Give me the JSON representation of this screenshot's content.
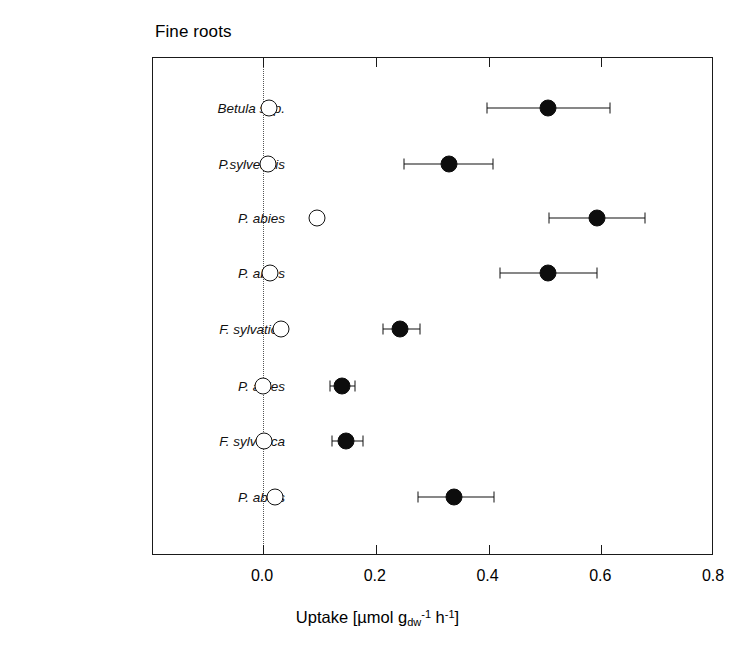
{
  "chart_data": {
    "type": "scatter",
    "title": "Fine roots",
    "xlabel": "Uptake [µmol g",
    "xlabel_sub": "dw",
    "xlabel_sup1": "-1",
    "xlabel_mid": " h",
    "xlabel_sup2": "-1",
    "xlabel_end": "]",
    "xlim": [
      0.0,
      0.8
    ],
    "xticks": [
      0.0,
      0.2,
      0.4,
      0.6,
      0.8
    ],
    "xtick_labels": [
      "0.0",
      "0.2",
      "0.4",
      "0.6",
      "0.8"
    ],
    "grid": false,
    "zero_reference_line": 0.0,
    "legend_position": "bottom-right",
    "legend": [
      {
        "key": "NO3",
        "label_main": "NO",
        "label_sub": "3",
        "label_sup": "-",
        "marker": "open-circle"
      },
      {
        "key": "NH4",
        "label_main": "NH",
        "label_sub": "4",
        "label_sup": "+",
        "marker": "filled-circle"
      }
    ],
    "site_labels": [
      {
        "name": "Åheden",
        "row": 0
      },
      {
        "name": "Klosterhede",
        "row": 3
      },
      {
        "name": "Schacht",
        "row": 4
      },
      {
        "name": "Waldstein",
        "row": 5
      },
      {
        "name": "Aubure",
        "row": 6
      }
    ],
    "categories": [
      "Betula spp.",
      "P.sylvestris",
      "P. abies",
      "P. abies",
      "F. sylvatica",
      "P. abies",
      "F. sylvatica",
      "P. abies"
    ],
    "series": [
      {
        "name": "NO3",
        "marker": "open-circle",
        "values": [
          0.01,
          0.008,
          0.095,
          0.012,
          0.032,
          0.0,
          0.002,
          0.022
        ],
        "err_low": [
          0.004,
          0.004,
          0.088,
          0.004,
          0.026,
          0.0,
          0.0,
          0.014
        ],
        "err_high": [
          0.018,
          0.014,
          0.104,
          0.02,
          0.04,
          0.006,
          0.008,
          0.03
        ]
      },
      {
        "name": "NH4",
        "marker": "filled-circle",
        "values": [
          0.505,
          0.33,
          0.592,
          0.505,
          0.243,
          0.14,
          0.148,
          0.338
        ],
        "err_low": [
          0.398,
          0.25,
          0.508,
          0.42,
          0.213,
          0.118,
          0.123,
          0.275
        ],
        "err_high": [
          0.615,
          0.408,
          0.678,
          0.592,
          0.278,
          0.163,
          0.178,
          0.41
        ]
      }
    ]
  }
}
